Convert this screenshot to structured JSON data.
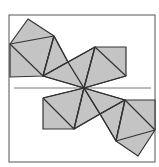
{
  "diagram": {
    "type": "geometric-net",
    "colors": {
      "fill": "#c4c4c4",
      "stroke": "#333333",
      "frame": "#555555",
      "background": "#ffffff"
    },
    "frame": {
      "x": 9,
      "y": 15,
      "w": 146,
      "h": 147
    },
    "center": {
      "x": 84,
      "y": 88
    },
    "reference_line": {
      "x1": 14,
      "y1": 88,
      "x2": 151,
      "y2": 88
    },
    "polygons": [
      {
        "name": "top-left-square-a",
        "points": "10,44 28,19 54,36 43,76 10,77"
      },
      {
        "name": "top-left-tri",
        "points": "43,76 54,36 68,62"
      },
      {
        "name": "top-center-tri",
        "points": "43,76 68,62 84,88"
      },
      {
        "name": "top-center-tri-2",
        "points": "68,62 95,47 84,88"
      },
      {
        "name": "top-right-square",
        "points": "95,47 126,47 126,76 84,88"
      },
      {
        "name": "bottom-left-square",
        "points": "43,98 84,88 74,129 43,129"
      },
      {
        "name": "bottom-center-tri",
        "points": "84,88 100,114 74,129"
      },
      {
        "name": "bottom-right-tri",
        "points": "84,88 125,100 100,114"
      },
      {
        "name": "bottom-right-tri-2",
        "points": "100,114 125,100 116,141"
      },
      {
        "name": "bottom-right-square",
        "points": "125,100 155,100 155,130 138,156 116,141"
      }
    ],
    "edges": [
      {
        "x1": 10,
        "y1": 44,
        "x2": 54,
        "y2": 36
      },
      {
        "x1": 10,
        "y1": 44,
        "x2": 43,
        "y2": 76
      },
      {
        "x1": 43,
        "y1": 76,
        "x2": 54,
        "y2": 36
      },
      {
        "x1": 43,
        "y1": 76,
        "x2": 68,
        "y2": 62
      },
      {
        "x1": 68,
        "y1": 62,
        "x2": 54,
        "y2": 36
      },
      {
        "x1": 43,
        "y1": 76,
        "x2": 84,
        "y2": 88
      },
      {
        "x1": 68,
        "y1": 62,
        "x2": 95,
        "y2": 47
      },
      {
        "x1": 95,
        "y1": 47,
        "x2": 84,
        "y2": 88
      },
      {
        "x1": 95,
        "y1": 47,
        "x2": 126,
        "y2": 76
      },
      {
        "x1": 126,
        "y1": 76,
        "x2": 84,
        "y2": 88
      },
      {
        "x1": 43,
        "y1": 98,
        "x2": 84,
        "y2": 88
      },
      {
        "x1": 43,
        "y1": 98,
        "x2": 74,
        "y2": 129
      },
      {
        "x1": 74,
        "y1": 129,
        "x2": 84,
        "y2": 88
      },
      {
        "x1": 74,
        "y1": 129,
        "x2": 100,
        "y2": 114
      },
      {
        "x1": 100,
        "y1": 114,
        "x2": 84,
        "y2": 88
      },
      {
        "x1": 84,
        "y1": 88,
        "x2": 125,
        "y2": 100
      },
      {
        "x1": 100,
        "y1": 114,
        "x2": 125,
        "y2": 100
      },
      {
        "x1": 125,
        "y1": 100,
        "x2": 116,
        "y2": 141
      },
      {
        "x1": 100,
        "y1": 114,
        "x2": 116,
        "y2": 141
      },
      {
        "x1": 116,
        "y1": 141,
        "x2": 155,
        "y2": 130
      },
      {
        "x1": 125,
        "y1": 100,
        "x2": 155,
        "y2": 130
      }
    ]
  }
}
